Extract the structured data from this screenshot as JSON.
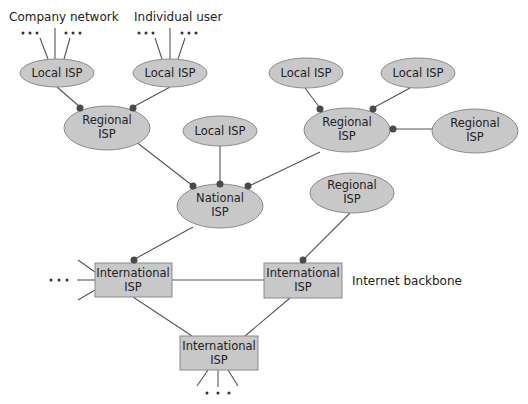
{
  "diagram": {
    "type": "network-hierarchy",
    "labels": {
      "company_network": "Company network",
      "individual_user": "Individual user",
      "internet_backbone": "Internet backbone"
    },
    "nodes": {
      "local_isp_1": {
        "line1": "Local ISP",
        "line2": ""
      },
      "local_isp_2": {
        "line1": "Local ISP",
        "line2": ""
      },
      "local_isp_3": {
        "line1": "Local ISP",
        "line2": ""
      },
      "local_isp_4": {
        "line1": "Local ISP",
        "line2": ""
      },
      "local_isp_5": {
        "line1": "Local ISP",
        "line2": ""
      },
      "regional_isp_1": {
        "line1": "Regional",
        "line2": "ISP"
      },
      "regional_isp_2": {
        "line1": "Regional",
        "line2": "ISP"
      },
      "regional_isp_3": {
        "line1": "Regional",
        "line2": "ISP"
      },
      "regional_isp_4": {
        "line1": "Regional",
        "line2": "ISP"
      },
      "national_isp": {
        "line1": "National",
        "line2": "ISP"
      },
      "international_isp_1": {
        "line1": "International",
        "line2": "ISP"
      },
      "international_isp_2": {
        "line1": "International",
        "line2": "ISP"
      },
      "international_isp_3": {
        "line1": "International",
        "line2": "ISP"
      }
    },
    "edges": [
      [
        "company_network",
        "local_isp_1"
      ],
      [
        "individual_user",
        "local_isp_2"
      ],
      [
        "local_isp_1",
        "regional_isp_1"
      ],
      [
        "local_isp_2",
        "regional_isp_1"
      ],
      [
        "local_isp_3",
        "regional_isp_2"
      ],
      [
        "local_isp_4",
        "regional_isp_2"
      ],
      [
        "regional_isp_3",
        "regional_isp_2"
      ],
      [
        "regional_isp_1",
        "national_isp"
      ],
      [
        "local_isp_5",
        "national_isp"
      ],
      [
        "regional_isp_2",
        "national_isp"
      ],
      [
        "national_isp",
        "international_isp_1"
      ],
      [
        "regional_isp_4",
        "international_isp_2"
      ],
      [
        "international_isp_1",
        "international_isp_2"
      ],
      [
        "international_isp_1",
        "international_isp_3"
      ],
      [
        "international_isp_2",
        "international_isp_3"
      ]
    ],
    "ellipsis": "• • •"
  }
}
